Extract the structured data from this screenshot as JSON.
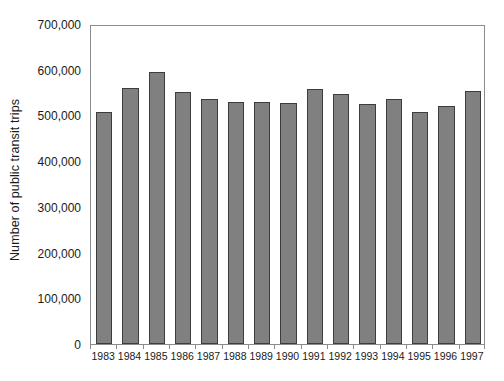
{
  "chart_data": {
    "type": "bar",
    "title": "",
    "subtitle": "",
    "xlabel": "",
    "ylabel": "Number of public transit trips",
    "categories": [
      "1983",
      "1984",
      "1985",
      "1986",
      "1987",
      "1988",
      "1989",
      "1990",
      "1991",
      "1992",
      "1993",
      "1994",
      "1995",
      "1996",
      "1997"
    ],
    "values": [
      508000,
      561000,
      594000,
      551000,
      535000,
      529000,
      529000,
      528000,
      558000,
      547000,
      525000,
      536000,
      508000,
      521000,
      553000
    ],
    "ylim": [
      0,
      700000
    ],
    "ytick_values": [
      0,
      100000,
      200000,
      300000,
      400000,
      500000,
      600000,
      700000
    ],
    "ytick_labels": [
      "0",
      "100,000",
      "200,000",
      "300,000",
      "400,000",
      "500,000",
      "600,000",
      "700,000"
    ],
    "grid": false,
    "legend": null,
    "legend_position": "none",
    "bar_color": "#808080",
    "bar_edge_color": "#3d3d3d",
    "axis_color": "#8c8c8c",
    "background_color": "#ffffff",
    "annotations": []
  }
}
